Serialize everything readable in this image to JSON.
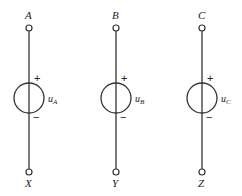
{
  "diagram": {
    "type": "three voltage sources (three-phase windings)",
    "line_color": "#333333",
    "sources": [
      {
        "top_terminal": "A",
        "bottom_terminal": "X",
        "voltage": "u",
        "voltage_sub": "A",
        "plus": "+",
        "minus": "−",
        "x": 29
      },
      {
        "top_terminal": "B",
        "bottom_terminal": "Y",
        "voltage": "u",
        "voltage_sub": "B",
        "plus": "+",
        "minus": "−",
        "x": 116
      },
      {
        "top_terminal": "C",
        "bottom_terminal": "Z",
        "voltage": "u",
        "voltage_sub": "C",
        "plus": "+",
        "minus": "−",
        "x": 202
      }
    ]
  }
}
